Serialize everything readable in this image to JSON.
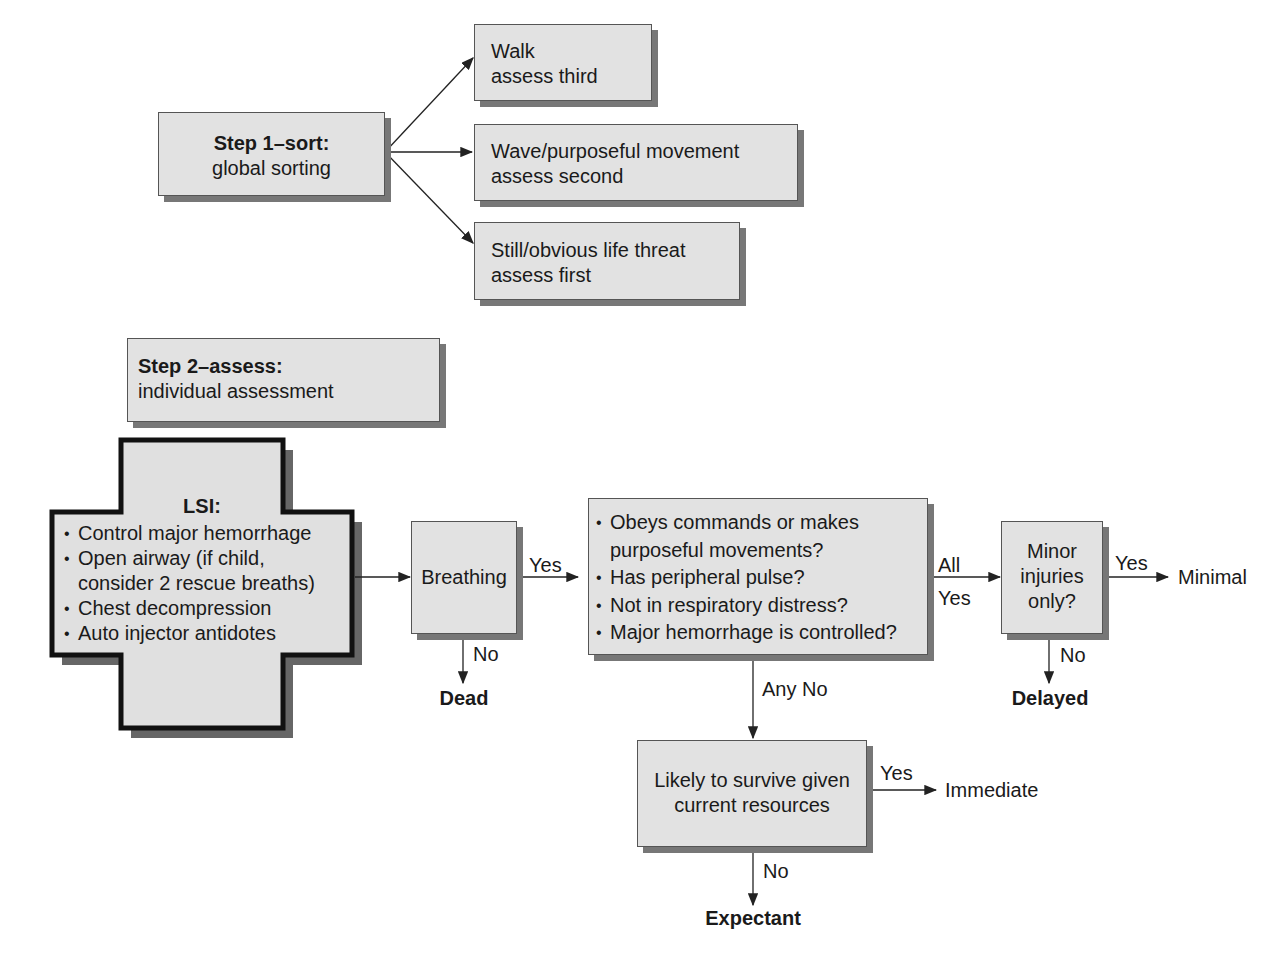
{
  "step1": {
    "title": "Step 1–sort:",
    "subtitle": "global sorting"
  },
  "sort_boxes": [
    {
      "line1": "Walk",
      "line2": "assess third"
    },
    {
      "line1": "Wave/purposeful movement",
      "line2": "assess second"
    },
    {
      "line1": "Still/obvious life threat",
      "line2": "assess first"
    }
  ],
  "step2": {
    "title": "Step 2–assess:",
    "subtitle": "individual assessment"
  },
  "lsi": {
    "title": "LSI:",
    "items": [
      "Control major hemorrhage",
      "Open airway (if child,",
      "consider 2 rescue breaths)",
      "Chest decompression",
      "Auto injector antidotes"
    ]
  },
  "breathing": {
    "label": "Breathing",
    "yes": "Yes",
    "no": "No",
    "no_outcome": "Dead"
  },
  "checks": {
    "items": [
      "Obeys commands or makes",
      "purposeful movements?",
      "Has peripheral pulse?",
      "Not in respiratory distress?",
      "Major hemorrhage is controlled?"
    ],
    "all_yes_1": "All",
    "all_yes_2": "Yes",
    "any_no": "Any No"
  },
  "minor": {
    "line1": "Minor",
    "line2": "injuries",
    "line3": "only?",
    "yes": "Yes",
    "yes_outcome": "Minimal",
    "no": "No",
    "no_outcome": "Delayed"
  },
  "survive": {
    "line1": "Likely to survive given",
    "line2": "current resources",
    "yes": "Yes",
    "yes_outcome": "Immediate",
    "no": "No",
    "no_outcome": "Expectant"
  }
}
